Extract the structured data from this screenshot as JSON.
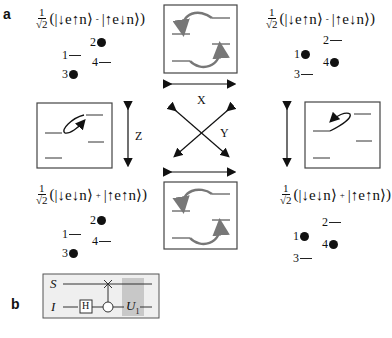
{
  "panels": {
    "a": {
      "label": "a",
      "prefactor": {
        "num": "1",
        "den": "√2"
      },
      "states": {
        "top_left": {
          "ket1": "|↓e↑n⟩",
          "sign": "-",
          "ket2": "|↑e↓n⟩"
        },
        "top_right": {
          "ket1": "|↓e↑n⟩",
          "sign": "-",
          "ket2": "|↑e↓n⟩"
        },
        "bottom_left": {
          "ket1": "|↓e↓n⟩",
          "sign": "+",
          "ket2": "|↑e↑n⟩"
        },
        "bottom_right": {
          "ket1": "|↓e↓n⟩",
          "sign": "+",
          "ket2": "|↑e↑n⟩"
        }
      },
      "levels": {
        "left_pattern": [
          {
            "n": "1",
            "filled": false
          },
          {
            "n": "2",
            "filled": true
          },
          {
            "n": "3",
            "filled": true
          },
          {
            "n": "4",
            "filled": false
          }
        ],
        "right_pattern": [
          {
            "n": "1",
            "filled": true
          },
          {
            "n": "2",
            "filled": false
          },
          {
            "n": "3",
            "filled": false
          },
          {
            "n": "4",
            "filled": true
          }
        ]
      },
      "axes": {
        "x": "X",
        "y": "Y",
        "z": "Z"
      }
    },
    "b": {
      "label": "b",
      "circuit": {
        "wires": [
          "S",
          "I"
        ],
        "gates": {
          "hadamard": "H",
          "unitary": "U",
          "unitary_sub": "1"
        },
        "shade_color": "#c8c8c8",
        "background": "#f0f0f0"
      }
    }
  }
}
